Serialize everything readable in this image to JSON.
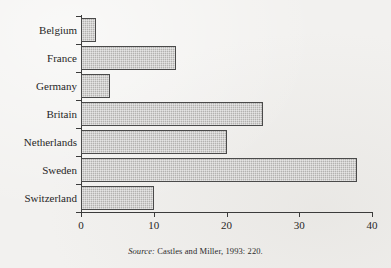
{
  "figure": {
    "title": "",
    "source_label": "Source:",
    "source_text": "Castles and Miller, 1993: 220."
  },
  "colors": {
    "background": "#f2f1ef",
    "axis": "#3b3b3b",
    "bar_fill": "#b3b2b0",
    "bar_border": "#4a4a4a",
    "text": "#272727"
  },
  "chart_data": {
    "type": "bar",
    "orientation": "horizontal",
    "title": "",
    "subtitle": "",
    "xlabel": "",
    "ylabel": "",
    "categories": [
      "Belgium",
      "France",
      "Germany",
      "Britain",
      "Netherlands",
      "Sweden",
      "Switzerland"
    ],
    "values": [
      2,
      13,
      4,
      25,
      20,
      38,
      10
    ],
    "xlim": [
      0,
      40
    ],
    "xticks": [
      0,
      10,
      20,
      30,
      40
    ],
    "xtick_labels": [
      "0",
      "10",
      "20",
      "30",
      "40"
    ],
    "grid": false,
    "legend": false,
    "annotations": [
      "Source: Castles and Miller, 1993: 220."
    ]
  }
}
